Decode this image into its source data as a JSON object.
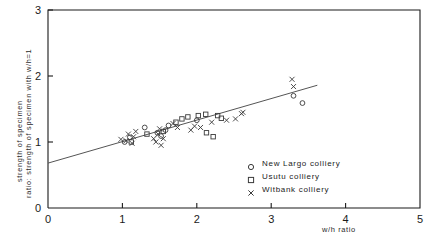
{
  "chart_data": {
    "type": "scatter",
    "title": "",
    "xlabel": "w/h ratio",
    "ylabel_line1": "ratio: strength of specimen with w/h=1",
    "ylabel_line2": "strength of specimen",
    "xlim": [
      0,
      5
    ],
    "ylim": [
      0,
      3
    ],
    "xticks": [
      "0",
      "1",
      "2",
      "3",
      "4",
      "5"
    ],
    "xtick_values": [
      0,
      1,
      2,
      3,
      4,
      5
    ],
    "yticks": [
      "0",
      "1",
      "2",
      "3"
    ],
    "ytick_values": [
      0,
      1,
      2,
      3
    ],
    "grid": false,
    "legend_position": "lower-right",
    "trend_line": {
      "x": [
        0.0,
        3.62
      ],
      "y": [
        0.68,
        1.86
      ]
    },
    "series": [
      {
        "name": "New Largo colliery",
        "marker": "circle-marker",
        "points": [
          [
            1.03,
            1.0
          ],
          [
            1.1,
            1.07
          ],
          [
            1.3,
            1.22
          ],
          [
            1.47,
            1.14
          ],
          [
            1.52,
            1.09
          ],
          [
            1.58,
            1.18
          ],
          [
            1.62,
            1.25
          ],
          [
            2.0,
            1.33
          ],
          [
            3.3,
            1.7
          ],
          [
            3.42,
            1.59
          ]
        ]
      },
      {
        "name": "Usutu colliery",
        "marker": "square-marker",
        "points": [
          [
            1.12,
            1.0
          ],
          [
            1.33,
            1.12
          ],
          [
            1.55,
            1.16
          ],
          [
            1.72,
            1.3
          ],
          [
            1.8,
            1.35
          ],
          [
            1.88,
            1.38
          ],
          [
            2.02,
            1.4
          ],
          [
            2.12,
            1.42
          ],
          [
            2.13,
            1.14
          ],
          [
            2.22,
            1.08
          ],
          [
            2.28,
            1.4
          ],
          [
            2.33,
            1.36
          ]
        ]
      },
      {
        "name": "Witbank colliery",
        "marker": "x-marker",
        "points": [
          [
            0.98,
            1.04
          ],
          [
            1.05,
            1.02
          ],
          [
            1.08,
            1.12
          ],
          [
            1.13,
            0.98
          ],
          [
            1.15,
            1.08
          ],
          [
            1.18,
            1.16
          ],
          [
            1.42,
            1.05
          ],
          [
            1.45,
            1.0
          ],
          [
            1.48,
            1.12
          ],
          [
            1.5,
            1.2
          ],
          [
            1.52,
            0.95
          ],
          [
            1.55,
            1.05
          ],
          [
            1.68,
            1.28
          ],
          [
            1.74,
            1.22
          ],
          [
            1.92,
            1.18
          ],
          [
            1.97,
            1.24
          ],
          [
            2.05,
            1.22
          ],
          [
            2.2,
            1.3
          ],
          [
            2.4,
            1.33
          ],
          [
            2.52,
            1.35
          ],
          [
            2.6,
            1.43
          ],
          [
            2.62,
            1.45
          ],
          [
            3.28,
            1.95
          ],
          [
            3.3,
            1.84
          ]
        ]
      }
    ],
    "colors": {
      "axis": "#1b1b1b",
      "marker": "#3a3a3a",
      "line": "#555555"
    }
  },
  "legend": {
    "rows": [
      {
        "label": "New Largo colliery",
        "marker": "circle-marker"
      },
      {
        "label": "Usutu colliery",
        "marker": "square-marker"
      },
      {
        "label": "Witbank colliery",
        "marker": "x-marker"
      }
    ]
  }
}
